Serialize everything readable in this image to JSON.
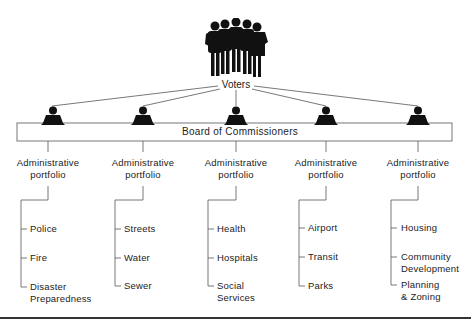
{
  "voters": {
    "label": "Voters",
    "icon": "voters-group-icon"
  },
  "board": {
    "label": "Board of Commissioners",
    "commissioner_icon": "commissioner-icon",
    "count": 5
  },
  "portfolios": [
    {
      "label_line1": "Administrative",
      "label_line2": "portfolio",
      "items": [
        {
          "line1": "Police",
          "line2": ""
        },
        {
          "line1": "Fire",
          "line2": ""
        },
        {
          "line1": "Disaster",
          "line2": "Preparedness"
        }
      ]
    },
    {
      "label_line1": "Administrative",
      "label_line2": "portfolio",
      "items": [
        {
          "line1": "Streets",
          "line2": ""
        },
        {
          "line1": "Water",
          "line2": ""
        },
        {
          "line1": "Sewer",
          "line2": ""
        }
      ]
    },
    {
      "label_line1": "Administrative",
      "label_line2": "portfolio",
      "items": [
        {
          "line1": "Health",
          "line2": ""
        },
        {
          "line1": "Hospitals",
          "line2": ""
        },
        {
          "line1": "Social",
          "line2": "Services"
        }
      ]
    },
    {
      "label_line1": "Administrative",
      "label_line2": "portfolio",
      "items": [
        {
          "line1": "Airport",
          "line2": ""
        },
        {
          "line1": "Transit",
          "line2": ""
        },
        {
          "line1": "Parks",
          "line2": ""
        }
      ]
    },
    {
      "label_line1": "Administrative",
      "label_line2": "portfolio",
      "items": [
        {
          "line1": "Housing",
          "line2": ""
        },
        {
          "line1": "Community",
          "line2": "Development"
        },
        {
          "line1": "Planning",
          "line2": "& Zoning"
        }
      ]
    }
  ],
  "colors": {
    "ink": "#111111",
    "line": "#555555",
    "rule": "#333333"
  }
}
